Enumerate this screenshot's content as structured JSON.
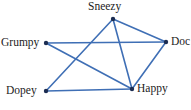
{
  "figure": {
    "name": "undirected-graph-seven-dwarfs",
    "background_color": "#ffffff",
    "width": 191,
    "height": 110
  },
  "style": {
    "edge_color": "#3f6fb5",
    "edge_width": 1.6,
    "node_color": "#1c2d52",
    "node_radius": 2.2,
    "label_color": "#1c1c1c",
    "label_font_size": 11.5
  },
  "chart_data": {
    "type": "diagram",
    "title": "",
    "nodes": [
      {
        "id": "sneezy",
        "label": "Sneezy",
        "x": 113,
        "y": 19
      },
      {
        "id": "grumpy",
        "label": "Grumpy",
        "x": 46,
        "y": 43
      },
      {
        "id": "doc",
        "label": "Doc",
        "x": 166,
        "y": 42
      },
      {
        "id": "dopey",
        "label": "Dopey",
        "x": 46,
        "y": 91
      },
      {
        "id": "happy",
        "label": "Happy",
        "x": 132,
        "y": 89
      }
    ],
    "edges": [
      {
        "source": "grumpy",
        "target": "doc"
      },
      {
        "source": "grumpy",
        "target": "happy"
      },
      {
        "source": "dopey",
        "target": "happy"
      },
      {
        "source": "dopey",
        "target": "sneezy"
      },
      {
        "source": "sneezy",
        "target": "happy"
      },
      {
        "source": "sneezy",
        "target": "doc"
      },
      {
        "source": "doc",
        "target": "happy"
      }
    ]
  },
  "labels": {
    "sneezy": "Sneezy",
    "grumpy": "Grumpy",
    "doc": "Doc",
    "dopey": "Dopey",
    "happy": "Happy"
  }
}
